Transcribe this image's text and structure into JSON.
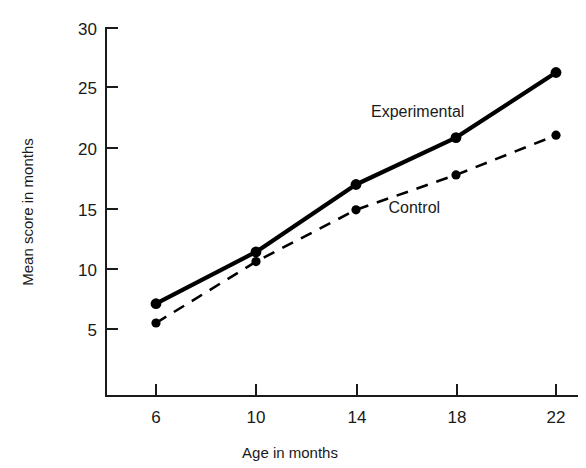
{
  "chart_data": {
    "type": "line",
    "title": "",
    "xlabel": "Age in months",
    "ylabel": "Mean score in months",
    "x": [
      6,
      10,
      14,
      18,
      22
    ],
    "xticklabels": [
      "6",
      "10",
      "14",
      "18",
      "22"
    ],
    "yticks": [
      5,
      10,
      15,
      20,
      25,
      30
    ],
    "yticklabels": [
      "5",
      "10",
      "15",
      "20",
      "25",
      "30"
    ],
    "xlim": [
      4,
      24
    ],
    "ylim": [
      0,
      30
    ],
    "grid": false,
    "legend_position": "inline-annotations",
    "series": [
      {
        "name": "Experimental",
        "values": [
          7.1,
          11.4,
          17.0,
          20.9,
          26.3
        ],
        "linestyle": "solid",
        "color": "#000000",
        "marker": "circle",
        "label_x": 14.6,
        "label_y": 22.6
      },
      {
        "name": "Control",
        "values": [
          5.5,
          10.6,
          14.9,
          17.8,
          21.1
        ],
        "linestyle": "dashed",
        "color": "#000000",
        "marker": "circle",
        "label_x": 15.3,
        "label_y": 14.6
      }
    ]
  },
  "axes": {
    "y_title": "Mean score in months",
    "x_title": "Age in months",
    "y_tick_30": "30",
    "y_tick_25": "25",
    "y_tick_20": "20",
    "y_tick_15": "15",
    "y_tick_10": "10",
    "y_tick_5": "5",
    "x_tick_6": "6",
    "x_tick_10": "10",
    "x_tick_14": "14",
    "x_tick_18": "18",
    "x_tick_22": "22"
  },
  "annotations": {
    "experimental_label": "Experimental",
    "control_label": "Control"
  },
  "colors": {
    "ink": "#000000",
    "background": "#ffffff"
  }
}
